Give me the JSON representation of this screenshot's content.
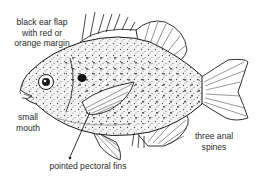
{
  "figure": {
    "colors": {
      "ink": "#1a1a1a",
      "label": "#2a2a2a",
      "background": "#ffffff"
    }
  },
  "labels": {
    "ear_flap": {
      "line1": "black ear flap",
      "line2": "with red or",
      "line3": "orange margin"
    },
    "mouth": {
      "line1": "small",
      "line2": "mouth"
    },
    "anal_spines": {
      "line1": "three anal",
      "line2": "spines"
    },
    "pectoral_fins": {
      "text": "pointed pectoral fins"
    }
  }
}
